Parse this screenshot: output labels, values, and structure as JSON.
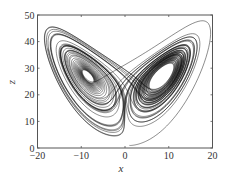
{
  "chart_data": {
    "type": "line",
    "title": "",
    "xlabel": "x",
    "ylabel": "z",
    "xlim": [
      -20,
      20
    ],
    "ylim": [
      0,
      50
    ],
    "xticks": [
      -20,
      -10,
      0,
      10,
      20
    ],
    "yticks": [
      0,
      10,
      20,
      30,
      40,
      50
    ],
    "xtick_labels": [
      "−20",
      "−10",
      "0",
      "10",
      "20"
    ],
    "ytick_labels": [
      "0",
      "10",
      "20",
      "30",
      "40",
      "50"
    ],
    "grid": false,
    "legend": null,
    "series": [
      {
        "name": "trajectory",
        "color": "#000000",
        "system": "lorenz",
        "params": {
          "sigma": 10,
          "rho": 28,
          "beta": 2.6667
        },
        "initial": [
          1,
          1,
          1
        ],
        "dt": 0.005,
        "steps": 12000,
        "transient": 0,
        "extents": {
          "x": [
            -17,
            19.5
          ],
          "z": [
            1,
            48
          ]
        }
      }
    ]
  }
}
